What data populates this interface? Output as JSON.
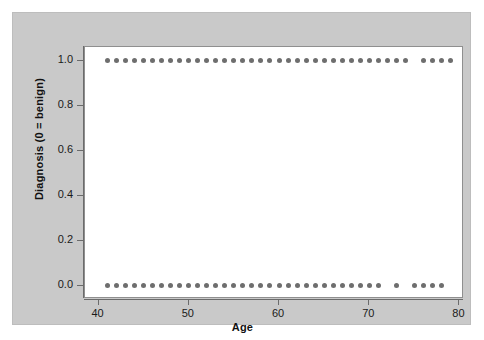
{
  "figure": {
    "background_color": "#c9c9c9",
    "plot_background_color": "#ffffff",
    "point_color": "#6e6e6e",
    "axis_color": "#6b6b6b"
  },
  "chart_data": {
    "type": "scatter",
    "title": "",
    "xlabel": "Age",
    "ylabel": "Diagnosis (0 = benign)",
    "xlim": [
      38.5,
      80.5
    ],
    "ylim": [
      -0.06,
      1.06
    ],
    "xticks": [
      40,
      50,
      60,
      70,
      80
    ],
    "xticklabels": [
      "40",
      "50",
      "60",
      "70",
      "80"
    ],
    "yticks": [
      0.0,
      0.2,
      0.4,
      0.6,
      0.8,
      1.0
    ],
    "yticklabels": [
      "0.0",
      "0.2",
      "0.4",
      "0.6",
      "0.8",
      "1.0"
    ],
    "grid": false,
    "legend": null,
    "series": [
      {
        "name": "malignant",
        "y": 1.0,
        "x": [
          41,
          42,
          43,
          44,
          45,
          46,
          47,
          48,
          49,
          50,
          51,
          52,
          53,
          54,
          55,
          56,
          57,
          58,
          59,
          60,
          61,
          62,
          63,
          64,
          65,
          66,
          67,
          68,
          69,
          70,
          71,
          72,
          73,
          74,
          76,
          77,
          78,
          79
        ]
      },
      {
        "name": "benign",
        "y": 0.0,
        "x": [
          41,
          42,
          43,
          44,
          45,
          46,
          47,
          48,
          49,
          50,
          51,
          52,
          53,
          54,
          55,
          56,
          57,
          58,
          59,
          60,
          61,
          62,
          63,
          64,
          65,
          66,
          67,
          68,
          69,
          70,
          71,
          73,
          75,
          76,
          77,
          78
        ]
      }
    ]
  }
}
